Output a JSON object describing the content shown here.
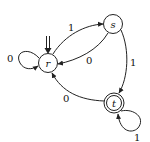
{
  "diagram": {
    "type": "finite-automaton",
    "states": [
      {
        "id": "r",
        "label": "r",
        "start": true,
        "accepting": false
      },
      {
        "id": "s",
        "label": "s",
        "start": false,
        "accepting": false
      },
      {
        "id": "t",
        "label": "t",
        "start": false,
        "accepting": true
      }
    ],
    "transitions": [
      {
        "from": "r",
        "to": "r",
        "label": "0"
      },
      {
        "from": "r",
        "to": "s",
        "label": "1"
      },
      {
        "from": "s",
        "to": "r",
        "label": "0"
      },
      {
        "from": "s",
        "to": "t",
        "label": "1"
      },
      {
        "from": "t",
        "to": "r",
        "label": "0"
      },
      {
        "from": "t",
        "to": "t",
        "label": "1"
      }
    ],
    "colors": {
      "stroke": "#222222",
      "background": "#ffffff"
    }
  }
}
